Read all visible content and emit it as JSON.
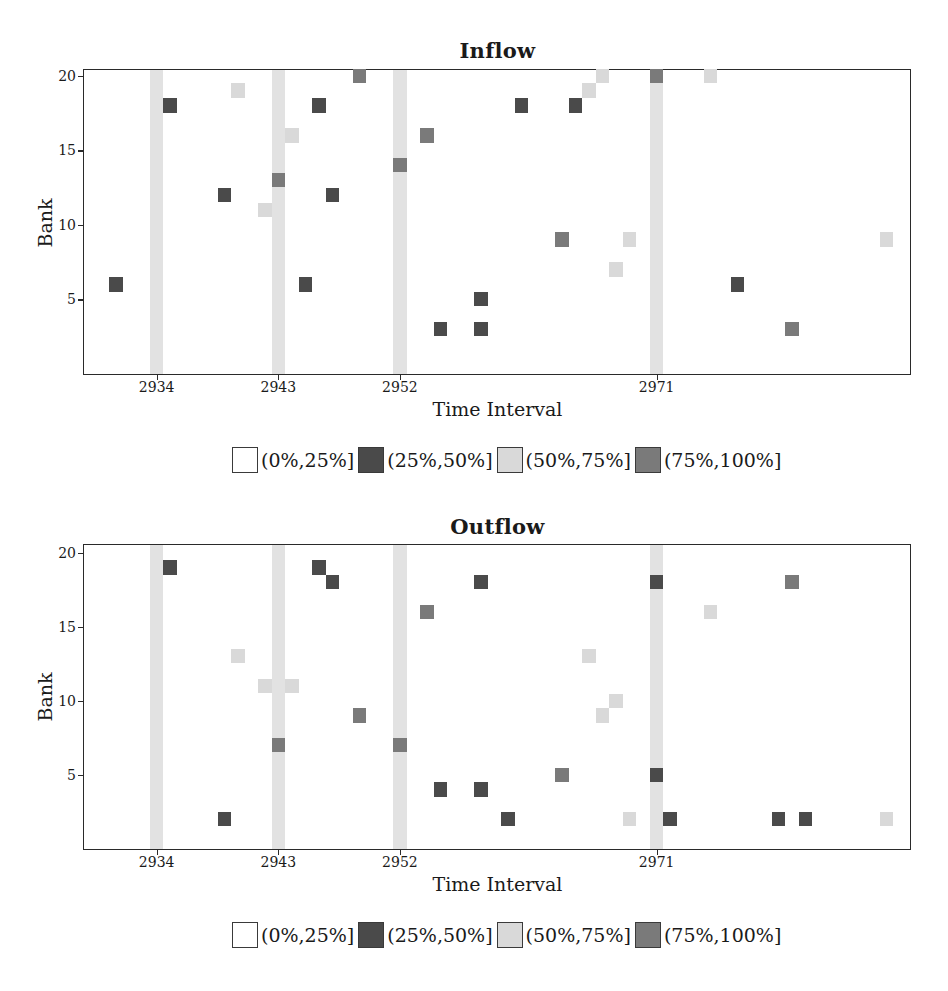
{
  "colors": {
    "c0": "#ffffff",
    "c1": "#4a4a4a",
    "c2": "#d9d9d9",
    "c3": "#7a7a7a",
    "band": "#e2e2e2"
  },
  "legend": [
    {
      "key": "c0",
      "label": "(0%,25%]"
    },
    {
      "key": "c1",
      "label": "(25%,50%]"
    },
    {
      "key": "c2",
      "label": "(50%,75%]"
    },
    {
      "key": "c3",
      "label": "(75%,100%]"
    }
  ],
  "chart_data": [
    {
      "type": "heatmap",
      "title": "Inflow",
      "xlabel": "Time Interval",
      "ylabel": "Bank",
      "xlim": [
        2928.62,
        2989.75
      ],
      "ylim": [
        0,
        20.4
      ],
      "xticks": [
        2934,
        2943,
        2952,
        2971
      ],
      "yticks": [
        5,
        10,
        15,
        20
      ],
      "grid": false,
      "legend_position": "below",
      "highlighted_columns": [
        2934,
        2943,
        2952,
        2971
      ],
      "categories": [
        "(0%,25%]",
        "(25%,50%]",
        "(50%,75%]",
        "(75%,100%]"
      ],
      "points": [
        {
          "t": 2931,
          "bank": 6,
          "cat": "c1"
        },
        {
          "t": 2935,
          "bank": 18,
          "cat": "c1"
        },
        {
          "t": 2939,
          "bank": 12,
          "cat": "c1"
        },
        {
          "t": 2940,
          "bank": 19,
          "cat": "c2"
        },
        {
          "t": 2942,
          "bank": 11,
          "cat": "c2"
        },
        {
          "t": 2943,
          "bank": 13,
          "cat": "c3"
        },
        {
          "t": 2944,
          "bank": 16,
          "cat": "c2"
        },
        {
          "t": 2945,
          "bank": 6,
          "cat": "c1"
        },
        {
          "t": 2946,
          "bank": 18,
          "cat": "c1"
        },
        {
          "t": 2947,
          "bank": 12,
          "cat": "c1"
        },
        {
          "t": 2949,
          "bank": 20,
          "cat": "c3"
        },
        {
          "t": 2952,
          "bank": 14,
          "cat": "c3"
        },
        {
          "t": 2954,
          "bank": 16,
          "cat": "c3"
        },
        {
          "t": 2955,
          "bank": 3,
          "cat": "c1"
        },
        {
          "t": 2958,
          "bank": 5,
          "cat": "c1"
        },
        {
          "t": 2958,
          "bank": 3,
          "cat": "c1"
        },
        {
          "t": 2961,
          "bank": 18,
          "cat": "c1"
        },
        {
          "t": 2964,
          "bank": 9,
          "cat": "c3"
        },
        {
          "t": 2965,
          "bank": 18,
          "cat": "c1"
        },
        {
          "t": 2966,
          "bank": 19,
          "cat": "c2"
        },
        {
          "t": 2967,
          "bank": 20,
          "cat": "c2"
        },
        {
          "t": 2968,
          "bank": 7,
          "cat": "c2"
        },
        {
          "t": 2969,
          "bank": 9,
          "cat": "c2"
        },
        {
          "t": 2971,
          "bank": 20,
          "cat": "c3"
        },
        {
          "t": 2975,
          "bank": 20,
          "cat": "c2"
        },
        {
          "t": 2977,
          "bank": 6,
          "cat": "c1"
        },
        {
          "t": 2981,
          "bank": 3,
          "cat": "c3"
        },
        {
          "t": 2988,
          "bank": 9,
          "cat": "c2"
        }
      ]
    },
    {
      "type": "heatmap",
      "title": "Outflow",
      "xlabel": "Time Interval",
      "ylabel": "Bank",
      "xlim": [
        2928.62,
        2989.75
      ],
      "ylim": [
        0,
        20.54
      ],
      "xticks": [
        2934,
        2943,
        2952,
        2971
      ],
      "yticks": [
        5,
        10,
        15,
        20
      ],
      "grid": false,
      "legend_position": "below",
      "highlighted_columns": [
        2934,
        2943,
        2952,
        2971
      ],
      "categories": [
        "(0%,25%]",
        "(25%,50%]",
        "(50%,75%]",
        "(75%,100%]"
      ],
      "points": [
        {
          "t": 2935,
          "bank": 19,
          "cat": "c1"
        },
        {
          "t": 2939,
          "bank": 2,
          "cat": "c1"
        },
        {
          "t": 2940,
          "bank": 13,
          "cat": "c2"
        },
        {
          "t": 2942,
          "bank": 11,
          "cat": "c2"
        },
        {
          "t": 2943,
          "bank": 7,
          "cat": "c3"
        },
        {
          "t": 2944,
          "bank": 11,
          "cat": "c2"
        },
        {
          "t": 2946,
          "bank": 19,
          "cat": "c1"
        },
        {
          "t": 2947,
          "bank": 18,
          "cat": "c1"
        },
        {
          "t": 2949,
          "bank": 9,
          "cat": "c3"
        },
        {
          "t": 2952,
          "bank": 7,
          "cat": "c3"
        },
        {
          "t": 2954,
          "bank": 16,
          "cat": "c3"
        },
        {
          "t": 2955,
          "bank": 4,
          "cat": "c1"
        },
        {
          "t": 2958,
          "bank": 18,
          "cat": "c1"
        },
        {
          "t": 2958,
          "bank": 4,
          "cat": "c1"
        },
        {
          "t": 2960,
          "bank": 2,
          "cat": "c1"
        },
        {
          "t": 2964,
          "bank": 5,
          "cat": "c3"
        },
        {
          "t": 2966,
          "bank": 13,
          "cat": "c2"
        },
        {
          "t": 2967,
          "bank": 9,
          "cat": "c2"
        },
        {
          "t": 2968,
          "bank": 10,
          "cat": "c2"
        },
        {
          "t": 2969,
          "bank": 2,
          "cat": "c2"
        },
        {
          "t": 2971,
          "bank": 18,
          "cat": "c1"
        },
        {
          "t": 2971,
          "bank": 5,
          "cat": "c1"
        },
        {
          "t": 2972,
          "bank": 2,
          "cat": "c1"
        },
        {
          "t": 2975,
          "bank": 16,
          "cat": "c2"
        },
        {
          "t": 2980,
          "bank": 2,
          "cat": "c1"
        },
        {
          "t": 2981,
          "bank": 18,
          "cat": "c3"
        },
        {
          "t": 2982,
          "bank": 2,
          "cat": "c1"
        },
        {
          "t": 2988,
          "bank": 2,
          "cat": "c2"
        }
      ]
    }
  ]
}
